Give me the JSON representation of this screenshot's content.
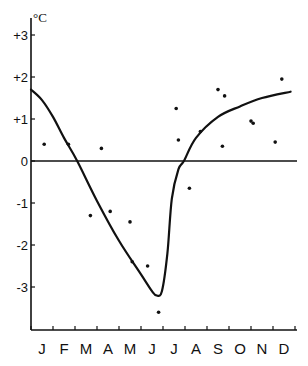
{
  "chart_data": {
    "type": "scatter",
    "title": "",
    "xlabel": "",
    "ylabel": "°C",
    "ylim": [
      -3.7,
      3.2
    ],
    "grid": false,
    "legend": null,
    "y_ticks": [
      "+3",
      "+2",
      "+1",
      "0",
      "-1",
      "-2",
      "-3"
    ],
    "y_tick_values": [
      3,
      2,
      1,
      0,
      -1,
      -2,
      -3
    ],
    "categories": [
      "J",
      "F",
      "M",
      "A",
      "M",
      "J",
      "J",
      "A",
      "S",
      "O",
      "N",
      "D"
    ],
    "series": [
      {
        "name": "observations",
        "kind": "points",
        "points": [
          {
            "x": 0.6,
            "y": 0.4
          },
          {
            "x": 1.7,
            "y": 0.4
          },
          {
            "x": 2.7,
            "y": -1.3
          },
          {
            "x": 3.2,
            "y": 0.3
          },
          {
            "x": 3.6,
            "y": -1.2
          },
          {
            "x": 4.5,
            "y": -1.45
          },
          {
            "x": 4.6,
            "y": -2.4
          },
          {
            "x": 5.3,
            "y": -2.5
          },
          {
            "x": 5.8,
            "y": -3.6
          },
          {
            "x": 6.6,
            "y": 1.25
          },
          {
            "x": 6.7,
            "y": 0.5
          },
          {
            "x": 7.2,
            "y": -0.65
          },
          {
            "x": 7.7,
            "y": 0.7
          },
          {
            "x": 8.5,
            "y": 1.7
          },
          {
            "x": 8.8,
            "y": 1.55
          },
          {
            "x": 8.7,
            "y": 0.35
          },
          {
            "x": 10.0,
            "y": 0.95
          },
          {
            "x": 10.1,
            "y": 0.9
          },
          {
            "x": 11.1,
            "y": 0.45
          },
          {
            "x": 11.4,
            "y": 1.95
          }
        ]
      },
      {
        "name": "fitted curve",
        "kind": "line",
        "points": [
          {
            "x": 0.0,
            "y": 1.7
          },
          {
            "x": 0.5,
            "y": 1.45
          },
          {
            "x": 1.0,
            "y": 1.05
          },
          {
            "x": 1.5,
            "y": 0.55
          },
          {
            "x": 2.1,
            "y": 0.0
          },
          {
            "x": 3.0,
            "y": -0.95
          },
          {
            "x": 4.0,
            "y": -1.9
          },
          {
            "x": 5.0,
            "y": -2.7
          },
          {
            "x": 5.5,
            "y": -3.1
          },
          {
            "x": 5.7,
            "y": -3.2
          },
          {
            "x": 5.95,
            "y": -3.1
          },
          {
            "x": 6.2,
            "y": -2.2
          },
          {
            "x": 6.4,
            "y": -0.9
          },
          {
            "x": 6.7,
            "y": -0.2
          },
          {
            "x": 6.95,
            "y": 0.0
          },
          {
            "x": 7.5,
            "y": 0.55
          },
          {
            "x": 8.5,
            "y": 1.05
          },
          {
            "x": 9.5,
            "y": 1.3
          },
          {
            "x": 10.5,
            "y": 1.5
          },
          {
            "x": 11.8,
            "y": 1.65
          }
        ]
      }
    ]
  }
}
